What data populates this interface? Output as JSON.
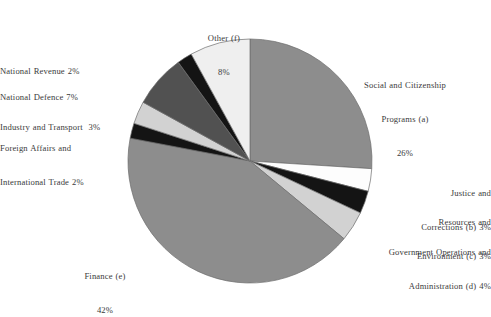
{
  "chart_data": {
    "type": "pie",
    "title": "",
    "subtitle": "",
    "xlabel": "",
    "ylabel": "",
    "legend_position": "none",
    "grid": false,
    "unit": "%",
    "start_angle_deg": 0,
    "direction": "clockwise",
    "total": 100,
    "categories": [
      "Social and Citizenship Programs (a)",
      "Justice and Corrections (b)",
      "Resources and Environment (c)",
      "Government Operations and Administration (d)",
      "Finance (e)",
      "Foreign Affairs and International Trade",
      "Industry and Transport",
      "National Defence",
      "National Revenue",
      "Other (f)"
    ],
    "values": [
      26,
      3,
      3,
      4,
      42,
      2,
      3,
      7,
      2,
      8
    ],
    "colors": [
      "#8d8d8d",
      "#fdfdfd",
      "#141414",
      "#d2d2d2",
      "#8d8d8d",
      "#141414",
      "#d2d2d2",
      "#515151",
      "#141414",
      "#efefef"
    ],
    "slices": [
      {
        "key": "a",
        "label": "Social and Citizenship Programs (a)",
        "value": 26,
        "value_text": "26%",
        "color": "#8d8d8d"
      },
      {
        "key": "b",
        "label": "Justice and Corrections (b)",
        "value": 3,
        "value_text": "3%",
        "color": "#fdfdfd"
      },
      {
        "key": "c",
        "label": "Resources and Environment (c)",
        "value": 3,
        "value_text": "3%",
        "color": "#141414"
      },
      {
        "key": "d",
        "label": "Government Operations and Administration (d)",
        "value": 4,
        "value_text": "4%",
        "color": "#d2d2d2"
      },
      {
        "key": "e",
        "label": "Finance (e)",
        "value": 42,
        "value_text": "42%",
        "color": "#8d8d8d"
      },
      {
        "key": "foreign",
        "label": "Foreign Affairs and International Trade",
        "value": 2,
        "value_text": "2%",
        "color": "#141414"
      },
      {
        "key": "industry",
        "label": "Industry and Transport",
        "value": 3,
        "value_text": "3%",
        "color": "#d2d2d2"
      },
      {
        "key": "defence",
        "label": "National Defence",
        "value": 7,
        "value_text": "7%",
        "color": "#515151"
      },
      {
        "key": "revenue",
        "label": "National Revenue",
        "value": 2,
        "value_text": "2%",
        "color": "#141414"
      },
      {
        "key": "f",
        "label": "Other (f)",
        "value": 8,
        "value_text": "8%",
        "color": "#efefef"
      }
    ],
    "geometry": {
      "cx": 250,
      "cy": 161,
      "r": 122
    }
  },
  "labels": {
    "other_l1": "Other (f)",
    "other_l2": "8%",
    "social_l1": "Social and Citizenship",
    "social_l2": "Programs (a)",
    "social_l3": "26%",
    "justice_l1": "Justice and",
    "justice_l2": "Corrections (b) 3%",
    "resources_l1": "Resources and",
    "resources_l2": "Environment (c) 3%",
    "government_l1": "Government Operations and",
    "government_l2": "Administration (d) 4%",
    "finance_l1": "Finance (e)",
    "finance_l2": "42%",
    "foreign_l1": "Foreign Affairs and",
    "foreign_l2": "International Trade 2%",
    "industry_l1": "Industry and Transport  3%",
    "defence_l1": "National Defence 7%",
    "revenue_l1": "National Revenue 2%"
  }
}
